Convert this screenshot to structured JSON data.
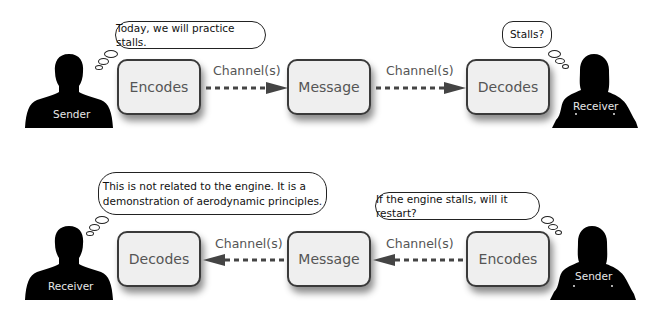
{
  "top_row": {
    "sender": {
      "label": "Sender",
      "icon": "person-silhouette-male"
    },
    "sender_thought": "Today, we will practice stalls.",
    "boxes": [
      {
        "label": "Encodes"
      },
      {
        "label": "Message"
      },
      {
        "label": "Decodes"
      }
    ],
    "channels": [
      {
        "label": "Channel(s)",
        "direction": "right"
      },
      {
        "label": "Channel(s)",
        "direction": "right"
      }
    ],
    "receiver": {
      "label": "Receiver",
      "icon": "person-silhouette-female"
    },
    "receiver_thought": "Stalls?"
  },
  "bottom_row": {
    "receiver": {
      "label": "Receiver",
      "icon": "person-silhouette-male"
    },
    "receiver_thought_line1": "This is not related to the engine. It is a",
    "receiver_thought_line2": "demonstration of aerodynamic principles.",
    "boxes": [
      {
        "label": "Decodes"
      },
      {
        "label": "Message"
      },
      {
        "label": "Encodes"
      }
    ],
    "channels": [
      {
        "label": "Channel(s)",
        "direction": "left"
      },
      {
        "label": "Channel(s)",
        "direction": "left"
      }
    ],
    "sender": {
      "label": "Sender",
      "icon": "person-silhouette-female"
    },
    "sender_thought": "If the engine stalls, will it restart?"
  },
  "colors": {
    "box_fill": "#efefef",
    "box_border": "#3a3a3a",
    "text_gray": "#555555",
    "silhouette": "#000000",
    "arrow": "#444444"
  }
}
